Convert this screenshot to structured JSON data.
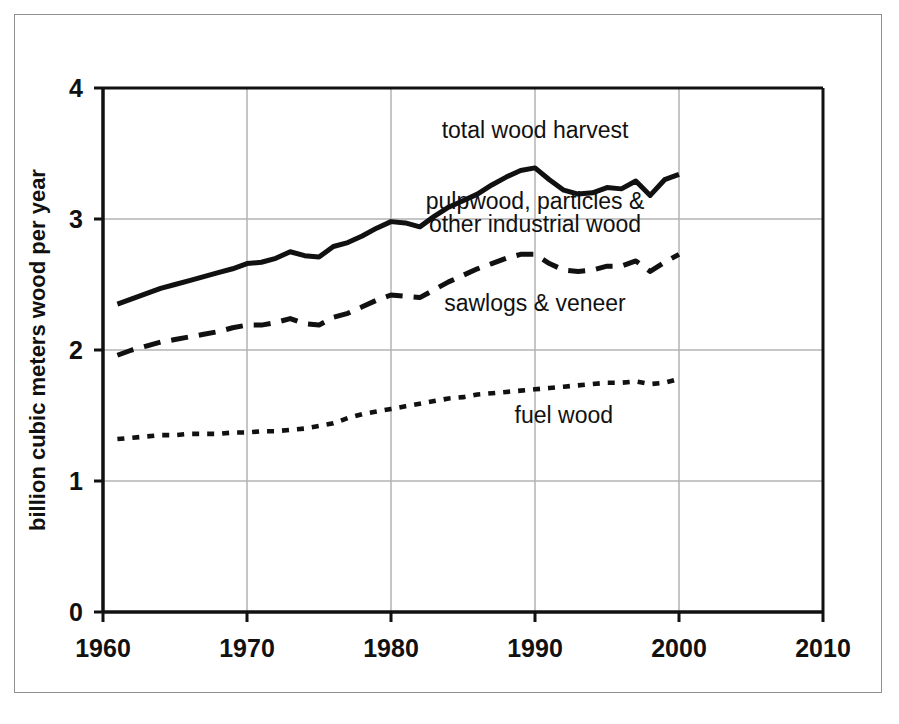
{
  "chart_data": {
    "type": "line",
    "title": "",
    "xlabel": "",
    "ylabel": "billion cubic meters wood per year",
    "xlim": [
      1960,
      2010
    ],
    "ylim": [
      0,
      4
    ],
    "xticks": [
      1960,
      1970,
      1980,
      1990,
      2000,
      2010
    ],
    "xtick_labels": [
      "1960",
      "1970",
      "1980",
      "1990",
      "2000",
      "2010"
    ],
    "yticks": [
      0,
      1,
      2,
      3,
      4
    ],
    "ytick_labels": [
      "0",
      "1",
      "2",
      "3",
      "4"
    ],
    "grid": true,
    "legend_position": "inline-annotations",
    "x": [
      1961,
      1962,
      1963,
      1964,
      1965,
      1966,
      1967,
      1968,
      1969,
      1970,
      1971,
      1972,
      1973,
      1974,
      1975,
      1976,
      1977,
      1978,
      1979,
      1980,
      1981,
      1982,
      1983,
      1984,
      1985,
      1986,
      1987,
      1988,
      1989,
      1990,
      1991,
      1992,
      1993,
      1994,
      1995,
      1996,
      1997,
      1998,
      1999,
      2000
    ],
    "series": [
      {
        "name": "total wood harvest",
        "style": "solid",
        "values": [
          2.35,
          2.39,
          2.43,
          2.47,
          2.5,
          2.53,
          2.56,
          2.59,
          2.62,
          2.66,
          2.67,
          2.7,
          2.75,
          2.72,
          2.71,
          2.79,
          2.82,
          2.87,
          2.93,
          2.98,
          2.97,
          2.94,
          3.02,
          3.09,
          3.14,
          3.19,
          3.26,
          3.32,
          3.37,
          3.39,
          3.3,
          3.22,
          3.19,
          3.2,
          3.24,
          3.23,
          3.29,
          3.18,
          3.3,
          3.34
        ]
      },
      {
        "name": "pulpwood, particles & other industrial wood",
        "style": "dashed",
        "values": [
          1.96,
          2.0,
          2.03,
          2.06,
          2.08,
          2.1,
          2.12,
          2.14,
          2.17,
          2.19,
          2.19,
          2.21,
          2.24,
          2.2,
          2.19,
          2.25,
          2.28,
          2.33,
          2.38,
          2.42,
          2.41,
          2.4,
          2.46,
          2.52,
          2.57,
          2.62,
          2.66,
          2.7,
          2.73,
          2.73,
          2.66,
          2.61,
          2.6,
          2.61,
          2.64,
          2.64,
          2.68,
          2.6,
          2.67,
          2.73
        ]
      },
      {
        "name": "fuel wood",
        "style": "dotted",
        "values": [
          1.32,
          1.33,
          1.34,
          1.35,
          1.35,
          1.36,
          1.36,
          1.36,
          1.37,
          1.37,
          1.38,
          1.38,
          1.39,
          1.4,
          1.42,
          1.44,
          1.48,
          1.51,
          1.53,
          1.55,
          1.57,
          1.59,
          1.61,
          1.63,
          1.64,
          1.66,
          1.67,
          1.68,
          1.69,
          1.7,
          1.71,
          1.72,
          1.73,
          1.74,
          1.75,
          1.75,
          1.76,
          1.74,
          1.75,
          1.78
        ]
      }
    ],
    "annotations": [
      {
        "text": "total wood harvest",
        "x": 1990,
        "y": 3.62
      },
      {
        "text": "pulpwood, particles &",
        "x": 1990,
        "y": 3.08
      },
      {
        "text": "other industrial wood",
        "x": 1990,
        "y": 2.9
      },
      {
        "text": "sawlogs & veneer",
        "x": 1990,
        "y": 2.3
      },
      {
        "text": "fuel wood",
        "x": 1992,
        "y": 1.44
      }
    ]
  },
  "colors": {
    "line": "#111111",
    "grid": "#b3b3b3",
    "axis": "#111111",
    "frame": "#8f8f8f",
    "background": "#ffffff"
  }
}
